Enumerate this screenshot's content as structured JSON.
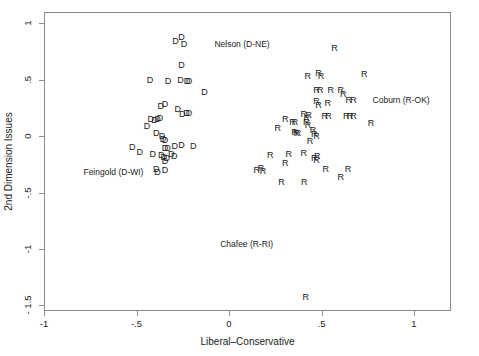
{
  "chart_data": {
    "type": "scatter",
    "title": "",
    "xlabel": "Liberal–Conservative",
    "ylabel": "2nd Dimension Issues",
    "xlim": [
      -1.0,
      1.2
    ],
    "ylim": [
      -1.55,
      1.1
    ],
    "xticks": [
      -1,
      -0.5,
      0,
      0.5,
      1
    ],
    "xticklabels": [
      "-1",
      "-.5",
      "0",
      ".5",
      "1"
    ],
    "yticks": [
      1,
      0.5,
      0,
      -0.5,
      -1,
      -1.5
    ],
    "yticklabels": [
      "1",
      ".5",
      "0",
      "-.5",
      "-1",
      "- 1.5"
    ],
    "grid": false,
    "legend": null,
    "marker_labels": {
      "democrat": "D",
      "republican": "R"
    },
    "annotations": [
      {
        "text": "Nelson (D-NE)",
        "x": 0.065,
        "y": 0.825
      },
      {
        "text": "Coburn (R-OK)",
        "x": 0.925,
        "y": 0.33
      },
      {
        "text": "Feingold (D-WI)",
        "x": -0.63,
        "y": -0.305
      },
      {
        "text": "Chafee (R-RI)",
        "x": 0.09,
        "y": -0.945
      }
    ],
    "series": [
      {
        "name": "Democrats",
        "marker": "D",
        "points": [
          [
            -0.295,
            0.855
          ],
          [
            -0.262,
            0.885
          ],
          [
            -0.248,
            0.825
          ],
          [
            -0.262,
            0.635
          ],
          [
            -0.432,
            0.505
          ],
          [
            -0.335,
            0.5
          ],
          [
            -0.268,
            0.505
          ],
          [
            -0.232,
            0.5
          ],
          [
            -0.222,
            0.495
          ],
          [
            -0.138,
            0.4
          ],
          [
            -0.375,
            0.28
          ],
          [
            -0.352,
            0.29
          ],
          [
            -0.282,
            0.245
          ],
          [
            -0.235,
            0.215
          ],
          [
            -0.222,
            0.21
          ],
          [
            -0.258,
            0.205
          ],
          [
            -0.428,
            0.16
          ],
          [
            -0.408,
            0.155
          ],
          [
            -0.392,
            0.16
          ],
          [
            -0.378,
            0.165
          ],
          [
            -0.448,
            0.095
          ],
          [
            -0.398,
            0.04
          ],
          [
            -0.368,
            0.01
          ],
          [
            -0.362,
            -0.015
          ],
          [
            -0.352,
            -0.03
          ],
          [
            -0.528,
            -0.09
          ],
          [
            -0.488,
            -0.13
          ],
          [
            -0.352,
            -0.095
          ],
          [
            -0.338,
            -0.1
          ],
          [
            -0.298,
            -0.075
          ],
          [
            -0.262,
            -0.07
          ],
          [
            -0.198,
            -0.075
          ],
          [
            -0.418,
            -0.15
          ],
          [
            -0.372,
            -0.16
          ],
          [
            -0.358,
            -0.175
          ],
          [
            -0.342,
            -0.185
          ],
          [
            -0.318,
            -0.15
          ],
          [
            -0.302,
            -0.17
          ],
          [
            -0.352,
            -0.215
          ],
          [
            -0.398,
            -0.285
          ],
          [
            -0.392,
            -0.31
          ],
          [
            -0.352,
            -0.295
          ]
        ]
      },
      {
        "name": "Republicans",
        "marker": "R",
        "points": [
          [
            0.565,
            0.79
          ],
          [
            0.42,
            0.545
          ],
          [
            0.478,
            0.565
          ],
          [
            0.492,
            0.545
          ],
          [
            0.725,
            0.555
          ],
          [
            0.468,
            0.42
          ],
          [
            0.488,
            0.42
          ],
          [
            0.545,
            0.415
          ],
          [
            0.598,
            0.415
          ],
          [
            0.612,
            0.385
          ],
          [
            0.468,
            0.32
          ],
          [
            0.478,
            0.285
          ],
          [
            0.528,
            0.3
          ],
          [
            0.642,
            0.33
          ],
          [
            0.668,
            0.33
          ],
          [
            0.398,
            0.205
          ],
          [
            0.425,
            0.2
          ],
          [
            0.415,
            0.17
          ],
          [
            0.512,
            0.19
          ],
          [
            0.532,
            0.185
          ],
          [
            0.628,
            0.19
          ],
          [
            0.648,
            0.185
          ],
          [
            0.668,
            0.185
          ],
          [
            0.298,
            0.16
          ],
          [
            0.338,
            0.13
          ],
          [
            0.352,
            0.13
          ],
          [
            0.412,
            0.135
          ],
          [
            0.422,
            0.11
          ],
          [
            0.762,
            0.125
          ],
          [
            0.258,
            0.085
          ],
          [
            0.348,
            0.045
          ],
          [
            0.358,
            0.035
          ],
          [
            0.368,
            0.04
          ],
          [
            0.448,
            0.065
          ],
          [
            0.455,
            0.025
          ],
          [
            0.468,
            0.01
          ],
          [
            0.432,
            -0.035
          ],
          [
            0.218,
            -0.155
          ],
          [
            0.318,
            -0.15
          ],
          [
            0.398,
            -0.145
          ],
          [
            0.455,
            -0.185
          ],
          [
            0.468,
            -0.2
          ],
          [
            0.472,
            -0.165
          ],
          [
            0.298,
            -0.225
          ],
          [
            0.145,
            -0.29
          ],
          [
            0.168,
            -0.275
          ],
          [
            0.178,
            -0.3
          ],
          [
            0.518,
            -0.285
          ],
          [
            0.638,
            -0.28
          ],
          [
            0.598,
            -0.355
          ],
          [
            0.278,
            -0.395
          ],
          [
            0.402,
            -0.4
          ],
          [
            0.41,
            -1.42
          ]
        ]
      }
    ]
  }
}
